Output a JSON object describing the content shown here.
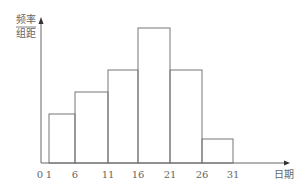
{
  "chart_data": {
    "type": "bar",
    "subtype": "histogram",
    "title": "",
    "xlabel": "日期",
    "ylabel_numerator": "频率",
    "ylabel_denominator": "组距",
    "origin_label": "0",
    "tick_labels": [
      "1",
      "6",
      "11",
      "16",
      "21",
      "26",
      "31"
    ],
    "categories": [
      "1-6",
      "6-11",
      "11-16",
      "16-21",
      "21-26",
      "26-31"
    ],
    "values": [
      49,
      71,
      93,
      135,
      93,
      24
    ],
    "value_note": "relative bar heights in pixels (no y tick values shown)",
    "grid": false,
    "legend": "none"
  }
}
